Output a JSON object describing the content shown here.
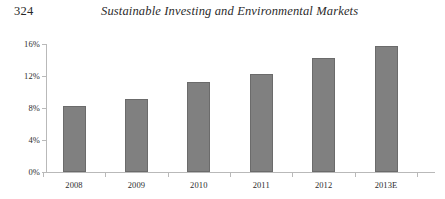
{
  "running_head": {
    "folio": "324",
    "title": "Sustainable Investing and Environmental Markets"
  },
  "chart_data": {
    "type": "bar",
    "title": "",
    "xlabel": "",
    "ylabel": "",
    "categories": [
      "2008",
      "2009",
      "2010",
      "2011",
      "2012",
      "2013E"
    ],
    "values": [
      8.3,
      9.1,
      11.2,
      12.3,
      14.2,
      15.8
    ],
    "ylim": [
      0,
      16
    ],
    "yticks": [
      0,
      4,
      8,
      12,
      16
    ],
    "ytick_labels": [
      "0%",
      "4%",
      "8%",
      "12%",
      "16%"
    ],
    "grid": false,
    "legend": null,
    "series": [
      {
        "name": "",
        "values": [
          8.3,
          9.1,
          11.2,
          12.3,
          14.2,
          15.8
        ],
        "color": "#808080",
        "edge_color": "#6b6b6b"
      }
    ]
  },
  "style": {
    "bar_fill": "#808080",
    "bar_edge": "#6b6b6b",
    "axis_color": "#b9b9b9",
    "text_color": "#2d2d2d",
    "background": "#ffffff"
  }
}
